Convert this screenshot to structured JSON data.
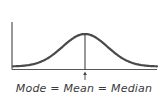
{
  "diagram": {
    "caption": "Mode = Mean = Median",
    "colors": {
      "curve": "#4a4a4a",
      "axis": "#555555",
      "marker": "#444444",
      "background": "#ffffff"
    },
    "curve": {
      "type": "normal",
      "mean": 0,
      "sd": 1,
      "x_range": [
        -3.2,
        3.2
      ]
    },
    "marker_at": 0
  }
}
